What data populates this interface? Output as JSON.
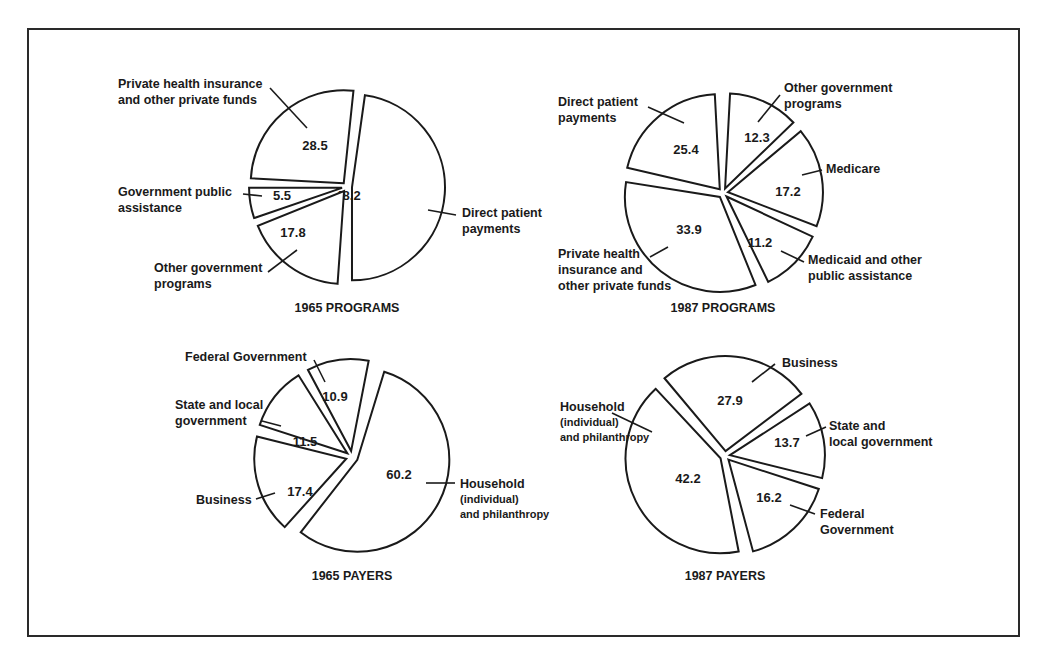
{
  "chart_data": [
    {
      "type": "pie",
      "title": "1965 PROGRAMS",
      "center": [
        347,
        187
      ],
      "radius": 93,
      "gap_deg": 3,
      "explode": 5,
      "slices": [
        {
          "label": "Direct patient payments",
          "label_lines": [
            "Direct patient",
            "payments"
          ],
          "value": 48.2,
          "start": 8,
          "end": 180,
          "value_pos": [
            348,
            200
          ],
          "label_pos": [
            462,
            217
          ],
          "label_anchor": "start",
          "leader": [
            [
              428,
              210
            ],
            [
              456,
              215
            ]
          ]
        },
        {
          "label": "Other government programs",
          "label_lines": [
            "Other government",
            "programs"
          ],
          "value": 17.8,
          "start": 184,
          "end": 248,
          "value_pos": [
            293,
            237
          ],
          "label_pos": [
            154,
            272
          ],
          "label_anchor": "start",
          "leader": [
            [
              297,
              250
            ],
            [
              268,
              272
            ]
          ]
        },
        {
          "label": "Government public assistance",
          "label_lines": [
            "Government public",
            "assistance"
          ],
          "value": 5.5,
          "start": 251,
          "end": 270,
          "value_pos": [
            282,
            200
          ],
          "label_pos": [
            118,
            196
          ],
          "label_anchor": "start",
          "leader": [
            [
              243,
              194
            ],
            [
              262,
              196
            ]
          ]
        },
        {
          "label": "Private health insurance and other private funds",
          "label_lines": [
            "Private health insurance",
            "and other private funds"
          ],
          "value": 28.5,
          "start": 273,
          "end": 366,
          "value_pos": [
            315,
            150
          ],
          "label_pos": [
            118,
            88
          ],
          "label_anchor": "start",
          "leader": [
            [
              270,
              88
            ],
            [
              307,
              128
            ]
          ]
        }
      ]
    },
    {
      "type": "pie",
      "title": "1987 PROGRAMS",
      "center": [
        723,
        193
      ],
      "radius": 95,
      "gap_deg": 3,
      "explode": 5,
      "slices": [
        {
          "label": "Other government programs",
          "label_lines": [
            "Other government",
            "programs"
          ],
          "value": 12.3,
          "start": 3,
          "end": 46,
          "value_pos": [
            757,
            142
          ],
          "label_pos": [
            784,
            92
          ],
          "label_anchor": "start",
          "leader": [
            [
              780,
              95
            ],
            [
              758,
              122
            ]
          ]
        },
        {
          "label": "Medicare",
          "label_lines": [
            "Medicare"
          ],
          "value": 17.2,
          "start": 50,
          "end": 111,
          "value_pos": [
            788,
            196
          ],
          "label_pos": [
            826,
            173
          ],
          "label_anchor": "start",
          "leader": [
            [
              822,
              170
            ],
            [
              802,
              175
            ]
          ]
        },
        {
          "label": "Medicaid and other public assistance",
          "label_lines": [
            "Medicaid and other",
            "public assistance"
          ],
          "value": 11.2,
          "start": 115,
          "end": 154,
          "value_pos": [
            760,
            247
          ],
          "label_pos": [
            808,
            264
          ],
          "label_anchor": "start",
          "leader": [
            [
              781,
              251
            ],
            [
              804,
              262
            ]
          ]
        },
        {
          "label": "Private health insurance and other private funds",
          "label_lines": [
            "Private health",
            "insurance and",
            "other private funds"
          ],
          "value": 33.9,
          "start": 158,
          "end": 279,
          "value_pos": [
            689,
            234
          ],
          "label_pos": [
            558,
            258
          ],
          "label_anchor": "start",
          "leader": [
            [
              668,
              247
            ],
            [
              650,
              257
            ]
          ]
        },
        {
          "label": "Direct patient payments",
          "label_lines": [
            "Direct patient",
            "payments"
          ],
          "value": 25.4,
          "start": 283,
          "end": 357,
          "value_pos": [
            686,
            154
          ],
          "label_pos": [
            558,
            106
          ],
          "label_anchor": "start",
          "leader": [
            [
              648,
              107
            ],
            [
              684,
              123
            ]
          ]
        }
      ]
    },
    {
      "type": "pie",
      "title": "1965 PAYERS",
      "center": [
        352,
        457
      ],
      "radius": 92,
      "gap_deg": 3,
      "explode": 6,
      "slices": [
        {
          "label": "Household (individual) and philanthropy",
          "label_lines": [
            "Household",
            "(individual)",
            "and philanthropy"
          ],
          "value": 60.2,
          "start": 17,
          "end": 218,
          "value_pos": [
            399,
            479
          ],
          "label_pos": [
            460,
            488
          ],
          "label_anchor": "start",
          "leader": [
            [
              426,
              483
            ],
            [
              455,
              483
            ]
          ]
        },
        {
          "label": "Business",
          "label_lines": [
            "Business"
          ],
          "value": 17.4,
          "start": 222,
          "end": 284,
          "value_pos": [
            300,
            496
          ],
          "label_pos": [
            196,
            504
          ],
          "label_anchor": "start",
          "leader": [
            [
              256,
              499
            ],
            [
              275,
              493
            ]
          ]
        },
        {
          "label": "State and local government",
          "label_lines": [
            "State and local",
            "government"
          ],
          "value": 11.5,
          "start": 288,
          "end": 328,
          "value_pos": [
            305,
            446
          ],
          "label_pos": [
            175,
            409
          ],
          "label_anchor": "start",
          "leader": [
            [
              262,
              421
            ],
            [
              281,
              426
            ]
          ]
        },
        {
          "label": "Federal Government",
          "label_lines": [
            "Federal Government"
          ],
          "value": 10.9,
          "start": 332,
          "end": 371,
          "value_pos": [
            335,
            401
          ],
          "label_pos": [
            185,
            361
          ],
          "label_anchor": "start",
          "leader": [
            [
              314,
              360
            ],
            [
              325,
              382
            ]
          ]
        }
      ]
    },
    {
      "type": "pie",
      "title": "1987 PAYERS",
      "center": [
        725,
        456
      ],
      "radius": 95,
      "gap_deg": 3,
      "explode": 5,
      "slices": [
        {
          "label": "Business",
          "label_lines": [
            "Business"
          ],
          "value": 27.9,
          "start": -40,
          "end": 53,
          "value_pos": [
            730,
            405
          ],
          "label_pos": [
            782,
            367
          ],
          "label_anchor": "start",
          "leader": [
            [
              775,
              364
            ],
            [
              752,
              382
            ]
          ]
        },
        {
          "label": "State and local government",
          "label_lines": [
            "State and",
            "local government"
          ],
          "value": 13.7,
          "start": 57,
          "end": 104,
          "value_pos": [
            787,
            447
          ],
          "label_pos": [
            829,
            430
          ],
          "label_anchor": "start",
          "leader": [
            [
              826,
              427
            ],
            [
              806,
              436
            ]
          ]
        },
        {
          "label": "Federal Government",
          "label_lines": [
            "Federal",
            "Government"
          ],
          "value": 16.2,
          "start": 108,
          "end": 165,
          "value_pos": [
            769,
            502
          ],
          "label_pos": [
            820,
            518
          ],
          "label_anchor": "start",
          "leader": [
            [
              790,
              505
            ],
            [
              815,
              514
            ]
          ]
        },
        {
          "label": "Household (individual) and philanthropy",
          "label_lines": [
            "Household",
            "(individual)",
            "and philanthropy"
          ],
          "value": 42.2,
          "start": 169,
          "end": 317,
          "value_pos": [
            688,
            483
          ],
          "label_pos": [
            560,
            411
          ],
          "label_anchor": "start",
          "leader": [
            [
              612,
              413
            ],
            [
              652,
              432
            ]
          ]
        }
      ]
    }
  ],
  "title_positions": [
    [
      347,
      312
    ],
    [
      723,
      312
    ],
    [
      352,
      580
    ],
    [
      725,
      580
    ]
  ]
}
